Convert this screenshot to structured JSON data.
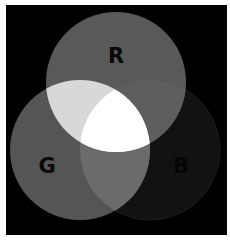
{
  "diagram": {
    "type": "venn",
    "background": "#000000",
    "sets": [
      {
        "id": "R",
        "label": "R",
        "cx": 116,
        "cy": 82,
        "r": 70,
        "fill": "#595959"
      },
      {
        "id": "G",
        "label": "G",
        "cx": 80,
        "cy": 150,
        "r": 70,
        "fill": "#555555"
      },
      {
        "id": "B",
        "label": "B",
        "cx": 150,
        "cy": 150,
        "r": 70,
        "fill": "#121212"
      }
    ],
    "intersections": {
      "R_G": "#d8d8d8",
      "R_B": "#5e5e5e",
      "G_B": "#6b6b6b",
      "R_G_B": "#ffffff"
    },
    "labels": {
      "R": "R",
      "G": "G",
      "B": "B"
    }
  }
}
